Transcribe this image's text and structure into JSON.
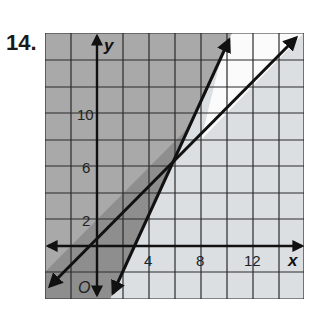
{
  "problem": {
    "number": "14."
  },
  "graph": {
    "x_axis_label": "x",
    "y_axis_label": "y",
    "origin_label": "O",
    "x_ticks": [
      "4",
      "8",
      "12"
    ],
    "y_ticks": [
      "2",
      "6",
      "10"
    ],
    "grid_unit": 2,
    "x_range": [
      -4,
      16
    ],
    "y_range": [
      -4,
      16
    ],
    "lines": [
      {
        "name": "steep-line",
        "equation": "y = 2x - 6",
        "through": [
          [
            1,
            -4
          ],
          [
            7,
            8
          ]
        ]
      },
      {
        "name": "shallow-line",
        "equation": "y = x + 1",
        "through": [
          [
            -4,
            -3
          ],
          [
            7,
            8
          ]
        ]
      }
    ],
    "intersection": [
      7,
      8
    ],
    "colors": {
      "overlap_shade": "#8e8e8e",
      "dark_shade": "#a9a9a9",
      "light_shade": "#dcdfe2",
      "unshaded": "#ffffff",
      "line": "#111111"
    }
  }
}
